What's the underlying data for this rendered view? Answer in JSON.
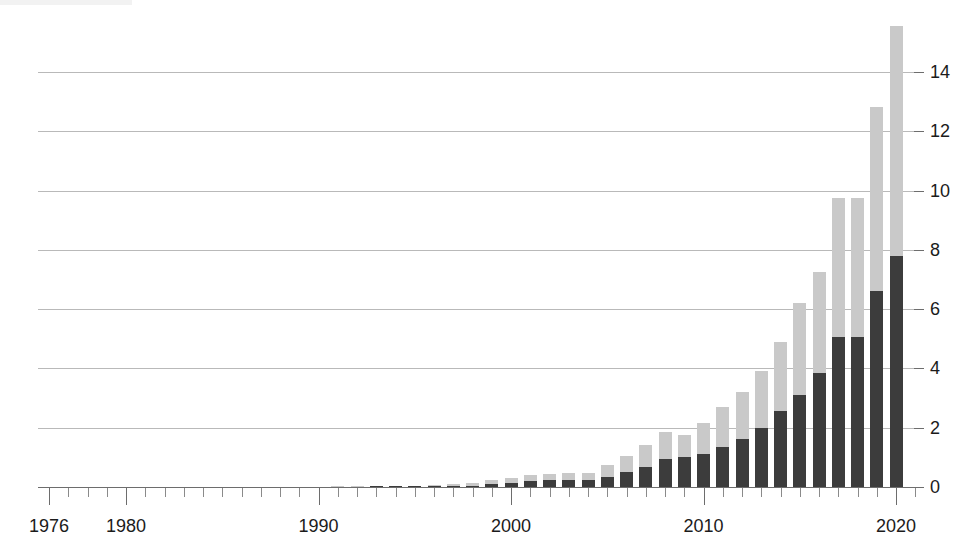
{
  "chart_data": {
    "type": "bar",
    "stacked": true,
    "title": "",
    "subtitle": "",
    "xlabel": "",
    "ylabel": "",
    "xlim": [
      1976,
      2021
    ],
    "ylim": [
      0,
      15.8
    ],
    "grid": true,
    "legend_position": "none",
    "y_axis_position": "right",
    "y_ticks": [
      0,
      2,
      4,
      6,
      8,
      10,
      12,
      14
    ],
    "y_tick_labels": [
      "0",
      "2",
      "4",
      "6",
      "8",
      "10",
      "12",
      "14"
    ],
    "x_tick_labels": [
      "1976",
      "1980",
      "1990",
      "2000",
      "2010",
      "2020"
    ],
    "x_major_ticks": [
      1976,
      1980,
      1990,
      2000,
      2010,
      2020
    ],
    "x_minor_tick_step": 1,
    "colors": {
      "series_dark": "#3c3c3c",
      "series_light": "#c9c9c9",
      "gridline": "#b9b9b9",
      "axis": "#6d6d6d",
      "text": "#1b1b1b",
      "background": "#ffffff"
    },
    "series": [
      {
        "name": "lower-segment",
        "color": "#3c3c3c",
        "values": [
          0.0,
          0.0,
          0.02,
          0.02,
          0.02,
          0.03,
          0.04,
          0.05,
          0.1,
          0.14,
          0.2,
          0.22,
          0.22,
          0.22,
          0.35,
          0.5,
          0.68,
          0.95,
          1.0,
          1.1,
          1.35,
          1.62,
          2.0,
          2.55,
          3.1,
          3.85,
          5.05,
          5.05,
          6.6,
          7.8
        ]
      },
      {
        "name": "upper-segment",
        "color": "#c9c9c9",
        "values": [
          0.02,
          0.02,
          0.02,
          0.03,
          0.03,
          0.04,
          0.05,
          0.08,
          0.12,
          0.15,
          0.2,
          0.22,
          0.25,
          0.25,
          0.4,
          0.55,
          0.75,
          0.9,
          0.75,
          1.05,
          1.35,
          1.6,
          1.9,
          2.35,
          3.1,
          3.4,
          4.7,
          4.7,
          6.2,
          7.75
        ]
      }
    ],
    "categories": [
      1991,
      1992,
      1993,
      1994,
      1995,
      1996,
      1997,
      1998,
      1999,
      2000,
      2001,
      2002,
      2003,
      2004,
      2005,
      2006,
      2007,
      2008,
      2009,
      2010,
      2011,
      2012,
      2013,
      2014,
      2015,
      2016,
      2017,
      2018,
      2019,
      2020
    ],
    "totals": [
      0.02,
      0.02,
      0.04,
      0.05,
      0.05,
      0.07,
      0.09,
      0.13,
      0.22,
      0.29,
      0.4,
      0.44,
      0.47,
      0.47,
      0.75,
      1.05,
      1.43,
      1.85,
      1.75,
      2.15,
      2.7,
      3.22,
      3.9,
      4.9,
      6.2,
      7.25,
      9.75,
      9.75,
      12.8,
      15.55
    ]
  }
}
